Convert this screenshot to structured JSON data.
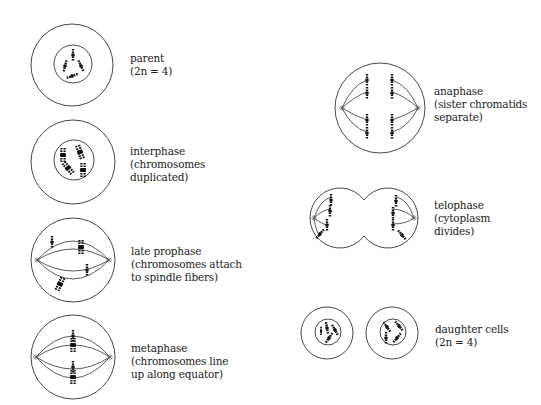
{
  "stages": [
    {
      "id": "parent",
      "name": "parent",
      "detail": "(2n = 4)"
    },
    {
      "id": "interphase",
      "name": "interphase",
      "detail1": "(chromosomes",
      "detail2": "duplicated)"
    },
    {
      "id": "late-prophase",
      "name": "late prophase",
      "detail1": "(chromosomes attach",
      "detail2": "to spindle fibers)"
    },
    {
      "id": "metaphase",
      "name": "metaphase",
      "detail1": "(chromosomes line",
      "detail2": "up along equator)"
    },
    {
      "id": "anaphase",
      "name": "anaphase",
      "detail1": "(sister chromatids",
      "detail2": "separate)"
    },
    {
      "id": "telophase",
      "name": "telophase",
      "detail1": "(cytoplasm",
      "detail2": "divides)"
    },
    {
      "id": "daughter-cells",
      "name": "daughter cells",
      "detail": "(2n = 4)"
    }
  ],
  "colors": {
    "line": "#333333",
    "chromosome": "#111111",
    "background": "#ffffff"
  }
}
